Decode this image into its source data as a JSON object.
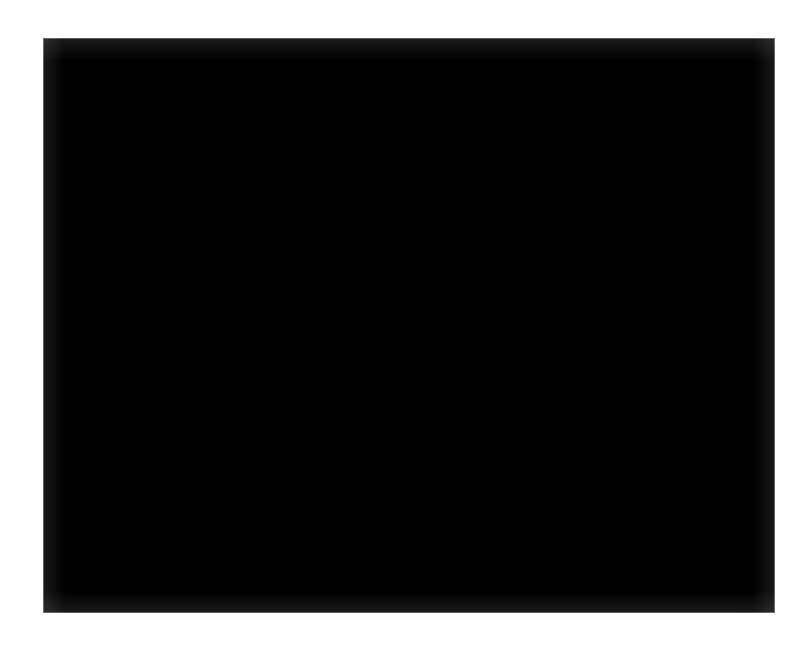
{
  "page": {
    "width": 808,
    "height": 651,
    "background_color": "#ffffff",
    "margin_tint_color": "#fdfdfc",
    "kind": "scanned-journal-figure-plate",
    "caption_text": "",
    "has_caption": false,
    "has_scale_bar": false,
    "has_labels": false
  },
  "figure": {
    "name": "histopathology-micrograph",
    "modality": "light-microscopy",
    "stain": "hematoxylin-and-eosin",
    "rendering": "grayscale halftone print scan",
    "x": 43,
    "y": 38,
    "width": 732,
    "height": 575,
    "background_color": "#c6c6c2",
    "light_tone_color": "#d8d8d4",
    "mid_tone_color": "#9a9a96",
    "dark_tone_color": "#2a2a28",
    "nucleus_dark_color": "#262624",
    "nucleus_mid_color": "#4a4a46",
    "nucleus_rim_color": "#1e1e1c",
    "nucleus_pale_center_color": "#b4b4b0",
    "cytoplasm_color": "#cacac6",
    "stroma_color": "#b0b0ac",
    "grain_strength": 0.2
  },
  "texture": {
    "seed": 20240917,
    "round_nuclei_count": 2600,
    "spindle_nuclei_count": 1700,
    "round_nucleus_radius_min": 3.0,
    "round_nucleus_radius_max": 6.2,
    "spindle_length_min": 9,
    "spindle_length_max": 26,
    "spindle_width_min": 2.2,
    "spindle_width_max": 4.4,
    "vesicular_ring_fraction": 0.34,
    "grain_dot_count": 26000
  },
  "tone_zones": [
    {
      "name": "upper-left-light-whorl",
      "cx": 0.18,
      "cy": 0.15,
      "rx": 0.16,
      "ry": 0.13,
      "delta": 0.1
    },
    {
      "name": "upper-mid-dark-fascicle",
      "cx": 0.42,
      "cy": 0.12,
      "rx": 0.13,
      "ry": 0.11,
      "delta": -0.12
    },
    {
      "name": "upper-right-light-band",
      "cx": 0.8,
      "cy": 0.1,
      "rx": 0.17,
      "ry": 0.12,
      "delta": 0.09
    },
    {
      "name": "center-pale-whorl",
      "cx": 0.5,
      "cy": 0.42,
      "rx": 0.17,
      "ry": 0.15,
      "delta": 0.11
    },
    {
      "name": "left-dark-fascicle",
      "cx": 0.13,
      "cy": 0.46,
      "rx": 0.13,
      "ry": 0.17,
      "delta": -0.11
    },
    {
      "name": "right-dark-fascicle",
      "cx": 0.84,
      "cy": 0.5,
      "rx": 0.14,
      "ry": 0.18,
      "delta": -0.1
    },
    {
      "name": "mid-right-light-patch",
      "cx": 0.66,
      "cy": 0.33,
      "rx": 0.12,
      "ry": 0.11,
      "delta": 0.08
    },
    {
      "name": "lower-left-dark-zone",
      "cx": 0.24,
      "cy": 0.74,
      "rx": 0.16,
      "ry": 0.14,
      "delta": -0.1
    },
    {
      "name": "lower-center-light-zone",
      "cx": 0.52,
      "cy": 0.68,
      "rx": 0.14,
      "ry": 0.12,
      "delta": 0.09
    },
    {
      "name": "lower-right-mixed-zone",
      "cx": 0.8,
      "cy": 0.8,
      "rx": 0.16,
      "ry": 0.14,
      "delta": -0.07
    },
    {
      "name": "bottom-dark-band",
      "cx": 0.45,
      "cy": 0.95,
      "rx": 0.3,
      "ry": 0.08,
      "delta": -0.09
    }
  ],
  "flow_field": {
    "description": "Swirling fascicular orientation field driving spindle-cell alignment",
    "centers": [
      {
        "cx": 0.2,
        "cy": 0.22,
        "strength": 1.0,
        "sense": 1
      },
      {
        "cx": 0.55,
        "cy": 0.4,
        "strength": 1.2,
        "sense": -1
      },
      {
        "cx": 0.84,
        "cy": 0.24,
        "strength": 0.9,
        "sense": 1
      },
      {
        "cx": 0.3,
        "cy": 0.72,
        "strength": 1.1,
        "sense": -1
      },
      {
        "cx": 0.72,
        "cy": 0.68,
        "strength": 1.0,
        "sense": 1
      },
      {
        "cx": 0.48,
        "cy": 0.9,
        "strength": 0.8,
        "sense": -1
      }
    ]
  }
}
